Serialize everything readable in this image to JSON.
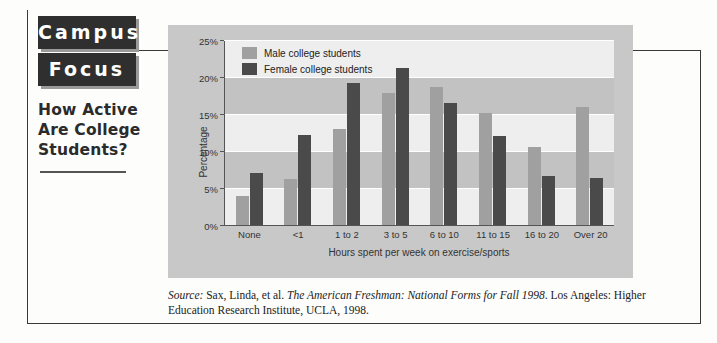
{
  "masthead": {
    "logo_line1": "Campus",
    "logo_line2": "Focus",
    "headline": "How Active Are College Students?"
  },
  "source_note": {
    "label": "Source:",
    "authors": " Sax, Linda, et al. ",
    "title": "The American Freshman: National Forms for Fall 1998",
    "rest": ". Los Angeles: Higher Education Research Institute, UCLA, 1998."
  },
  "chart_data": {
    "type": "bar",
    "title": "",
    "xlabel": "Hours spent per week on exercise/sports",
    "ylabel": "Percentage",
    "ylim": [
      0,
      25
    ],
    "yticks": [
      "0%",
      "5%",
      "10%",
      "15%",
      "20%",
      "25%"
    ],
    "ytick_values": [
      0,
      5,
      10,
      15,
      20,
      25
    ],
    "grid": true,
    "legend_position": "top-left",
    "categories": [
      "None",
      "<1",
      "1 to 2",
      "3 to 5",
      "6 to 10",
      "11 to 15",
      "16 to 20",
      "Over 20"
    ],
    "series": [
      {
        "name": "Male college students",
        "color": "#a0a0a0",
        "values": [
          4.0,
          6.2,
          13.0,
          18.0,
          18.7,
          15.2,
          10.6,
          16.0
        ]
      },
      {
        "name": "Female college students",
        "color": "#4a4a4a",
        "values": [
          7.1,
          12.2,
          19.3,
          21.3,
          16.6,
          12.1,
          6.7,
          6.4
        ]
      }
    ]
  }
}
